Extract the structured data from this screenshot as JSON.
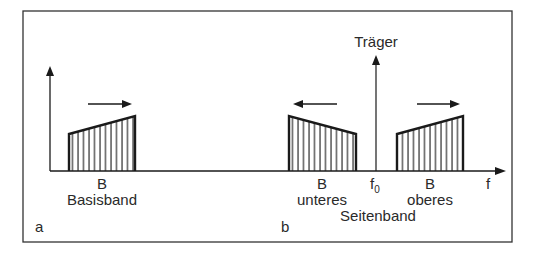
{
  "figure": {
    "panel_a": {
      "label": "a",
      "bandwidth_label": "B",
      "band_name": "Basisband"
    },
    "panel_b": {
      "label": "b",
      "carrier_label": "Träger",
      "carrier_freq_label": "f",
      "carrier_freq_subscript": "0",
      "axis_label": "f",
      "lower": {
        "bandwidth_label": "B",
        "name": "unteres"
      },
      "upper": {
        "bandwidth_label": "B",
        "name": "oberes"
      },
      "common_label": "Seitenband"
    },
    "colors": {
      "line": "#1a1a1a",
      "text": "#2a2a2a",
      "frame": "#333333"
    }
  }
}
